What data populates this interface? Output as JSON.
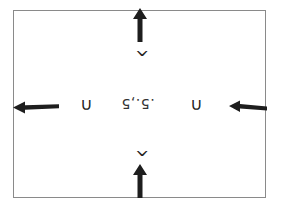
{
  "diagram": {
    "center_label": ".5.,5",
    "labels": {
      "top": "^",
      "bottom": "^",
      "left": "∩",
      "right": "∩"
    },
    "arrows": [
      {
        "position": "top",
        "direction": "up"
      },
      {
        "position": "bottom",
        "direction": "up"
      },
      {
        "position": "left",
        "direction": "left"
      },
      {
        "position": "right",
        "direction": "left"
      }
    ],
    "colors": {
      "arrow": "#1e1e1e",
      "frame": "#8a8a8a",
      "background": "#ffffff"
    }
  }
}
